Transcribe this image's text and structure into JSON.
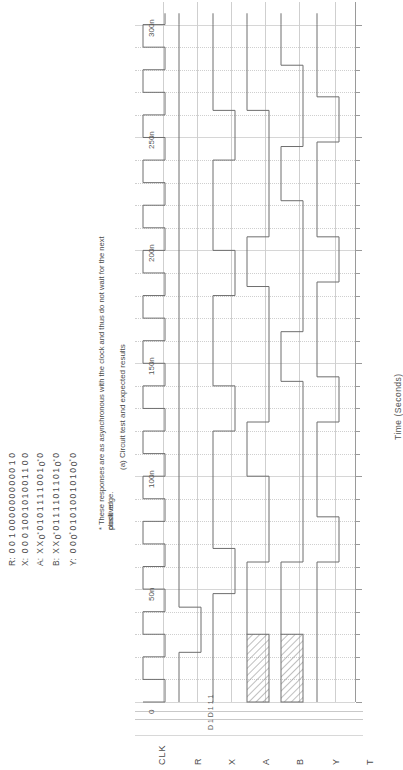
{
  "figure": {
    "caption": "(a) Circuit test and expected results",
    "footnote_line1": "* These responses are as asynchronous with the clock and thus do not wait for the next positive",
    "footnote_line2": "clock edge."
  },
  "table": {
    "row_labels": [
      "R:",
      "X:",
      "A:",
      "B:",
      "Y:"
    ],
    "rows": [
      {
        "label": "R:",
        "values": [
          "0",
          "0",
          "1",
          "0",
          "0",
          "0",
          "0",
          "0",
          "0",
          "0",
          "0",
          "0",
          "0",
          "1",
          "0"
        ]
      },
      {
        "label": "X:",
        "values": [
          "0",
          "0",
          "0",
          "1",
          "0",
          "0",
          "1",
          "0",
          "1",
          "0",
          "0",
          "1",
          "1",
          "0",
          "0"
        ]
      },
      {
        "label": "A:",
        "values": [
          "X",
          "X",
          "0*",
          "0",
          "1",
          "0",
          "1",
          "1",
          "1",
          "1",
          "0",
          "0",
          "1",
          "0*",
          "0"
        ]
      },
      {
        "label": "B:",
        "values": [
          "X",
          "X",
          "0*",
          "0",
          "1",
          "1",
          "1",
          "1",
          "0",
          "1",
          "1",
          "0",
          "1",
          "0*",
          "0"
        ]
      },
      {
        "label": "Y:",
        "values": [
          "0",
          "0",
          "0*",
          "0",
          "1",
          "0",
          "1",
          "0",
          "0",
          "1",
          "0",
          "1",
          "0",
          "0*",
          "0"
        ]
      }
    ]
  },
  "chart_data": {
    "type": "line",
    "title": "",
    "xlabel": "Time (Seconds)",
    "ylabel": "",
    "xlim": [
      0,
      310
    ],
    "tick_labels": [
      "0",
      "50n",
      "100n",
      "150n",
      "200n",
      "250n",
      "300n"
    ],
    "tick_values": [
      0,
      50,
      100,
      150,
      200,
      250,
      300
    ],
    "grid": true,
    "signals": [
      {
        "name": "CLK",
        "type": "clock",
        "period": 20,
        "start": 0
      },
      {
        "name": "R",
        "type": "digital",
        "transitions": [
          [
            0,
            0
          ],
          [
            22,
            1
          ],
          [
            42,
            0
          ],
          [
            300,
            0
          ]
        ]
      },
      {
        "name": "X",
        "type": "digital",
        "transitions": [
          [
            0,
            0
          ],
          [
            48,
            1
          ],
          [
            68,
            0
          ],
          [
            120,
            1
          ],
          [
            140,
            0
          ],
          [
            180,
            1
          ],
          [
            200,
            0
          ],
          [
            240,
            1
          ],
          [
            262,
            0
          ],
          [
            300,
            0
          ]
        ]
      },
      {
        "name": "A",
        "type": "digital",
        "unknown": [
          [
            0,
            30
          ]
        ],
        "transitions": [
          [
            30,
            0
          ],
          [
            62,
            1
          ],
          [
            100,
            0
          ],
          [
            124,
            1
          ],
          [
            184,
            0
          ],
          [
            206,
            1
          ],
          [
            262,
            0
          ],
          [
            300,
            0
          ]
        ]
      },
      {
        "name": "B",
        "type": "digital",
        "unknown": [
          [
            0,
            30
          ]
        ],
        "transitions": [
          [
            30,
            0
          ],
          [
            62,
            1
          ],
          [
            142,
            0
          ],
          [
            164,
            1
          ],
          [
            222,
            0
          ],
          [
            246,
            1
          ],
          [
            282,
            0
          ],
          [
            300,
            0
          ]
        ]
      },
      {
        "name": "Y",
        "type": "digital",
        "transitions": [
          [
            0,
            0
          ],
          [
            62,
            1
          ],
          [
            82,
            0
          ],
          [
            124,
            1
          ],
          [
            144,
            0
          ],
          [
            186,
            1
          ],
          [
            206,
            0
          ],
          [
            248,
            1
          ],
          [
            268,
            0
          ],
          [
            300,
            0
          ]
        ]
      },
      {
        "name": "T",
        "type": "axis"
      }
    ],
    "signal_names": [
      "CLK",
      "R",
      "X",
      "A",
      "B",
      "Y",
      "T"
    ],
    "mid_annotation": "D 1 D 1 1 1"
  },
  "colors": {
    "trace": "#6e6e6e",
    "grid": "#d6d6d6",
    "axis": "#9a9a9a",
    "text": "#4a4a4a",
    "hatch": "#8a8a8a"
  }
}
